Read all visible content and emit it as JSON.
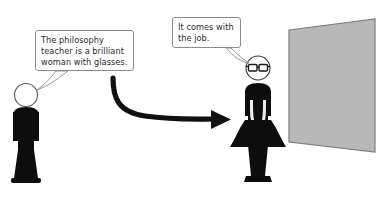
{
  "scene": {
    "title": "Philosophy teacher stereotype illustration",
    "width": 382,
    "height": 200,
    "background_color": "#ffffff"
  },
  "speech_bubbles": [
    {
      "id": "left",
      "speaker": "male-figure",
      "text": "The philosophy teacher is a brilliant woman with glasses.",
      "border_color": "#8c8c8c",
      "text_color": "#2b2b2b",
      "fill_color": "#ffffff"
    },
    {
      "id": "right",
      "speaker": "female-figure",
      "text": "It comes with the job.",
      "border_color": "#8c8c8c",
      "text_color": "#2b2b2b",
      "fill_color": "#ffffff"
    }
  ],
  "figures": [
    {
      "id": "male-figure",
      "label": "man silhouette",
      "body_color": "#0d0d0d",
      "head_outline_color": "#5a5a5a",
      "head_fill_color": "#ffffff",
      "has_glasses": false
    },
    {
      "id": "female-figure",
      "label": "woman silhouette in dress",
      "body_color": "#0d0d0d",
      "head_outline_color": "#3a3a3a",
      "head_fill_color": "#ffffff",
      "has_glasses": true
    }
  ],
  "arrow": {
    "label": "curved arrow from man to woman",
    "color": "#111111"
  },
  "board": {
    "label": "classroom board",
    "fill_color": "#b8b8b8",
    "edge_color": "#7d7d7d"
  },
  "icons": {
    "glasses": "glasses-icon",
    "arrow": "curved-arrow-icon"
  }
}
